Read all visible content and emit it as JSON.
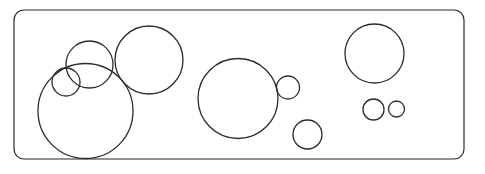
{
  "canvas": {
    "width": 485,
    "height": 174,
    "background_color": "#ffffff"
  },
  "frame": {
    "label": "rounded-rectangle-border",
    "x": 14,
    "y": 10,
    "width": 450,
    "height": 149,
    "corner_radius": 10,
    "stroke_color": "#2b2b2b",
    "stroke_width": 1.2,
    "fill": "none"
  },
  "style": {
    "circle_stroke_color": "#2b2b2b",
    "circle_stroke_width": 1.3,
    "circle_fill": "none"
  },
  "shapes": {
    "type": "circles",
    "count": 11,
    "items": [
      {
        "id": "circle-1",
        "name": "left-cluster-large-circle",
        "group": "left-cluster",
        "size_class": "large",
        "cx": 85.5,
        "cy": 111.0,
        "r": 47.5
      },
      {
        "id": "circle-2",
        "name": "left-cluster-medium-circle",
        "group": "left-cluster",
        "size_class": "medium",
        "cx": 89.5,
        "cy": 64.5,
        "r": 23.5
      },
      {
        "id": "circle-3",
        "name": "left-cluster-small-circle",
        "group": "left-cluster",
        "size_class": "small",
        "cx": 66.0,
        "cy": 82.0,
        "r": 14.0
      },
      {
        "id": "circle-4",
        "name": "top-left-large-circle",
        "group": "left-cluster",
        "size_class": "large",
        "cx": 149.0,
        "cy": 60.0,
        "r": 34.0
      },
      {
        "id": "circle-5",
        "name": "center-large-circle",
        "group": "center-cluster",
        "size_class": "large",
        "cx": 238.0,
        "cy": 98.5,
        "r": 40.0
      },
      {
        "id": "circle-6",
        "name": "center-right-small-circle",
        "group": "center-cluster",
        "size_class": "small",
        "cx": 288.0,
        "cy": 87.5,
        "r": 11.5
      },
      {
        "id": "circle-7",
        "name": "center-bottom-small-circle",
        "group": "center-cluster",
        "size_class": "small",
        "cx": 307.5,
        "cy": 134.5,
        "r": 14.5
      },
      {
        "id": "circle-8",
        "name": "right-top-large-circle",
        "group": "right-cluster",
        "size_class": "large",
        "cx": 374.5,
        "cy": 53.5,
        "r": 29.5
      },
      {
        "id": "circle-9",
        "name": "right-small-circle-left",
        "group": "right-cluster",
        "size_class": "small",
        "cx": 373.5,
        "cy": 109.5,
        "r": 10.5
      },
      {
        "id": "circle-10",
        "name": "right-small-circle-right",
        "group": "right-cluster",
        "size_class": "tiny",
        "cx": 396.5,
        "cy": 109.0,
        "r": 8.0
      }
    ]
  }
}
